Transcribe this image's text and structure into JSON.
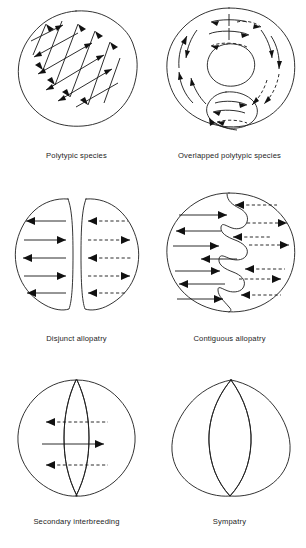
{
  "figure": {
    "background_color": "#ffffff",
    "ink_color": "#1a1a1a",
    "panel_count": 6,
    "columns": 2,
    "rows": 3
  },
  "panels": [
    {
      "id": "polytypic-species",
      "caption": "Polytypic species",
      "row": 1,
      "column": 1,
      "shape": "single irregular wobbly circle",
      "boundary": "none",
      "arrow_style": "solid diagonal crosshatch, bidirectional",
      "arrow_count": 16,
      "description": "One continuous range with gene flow arrows crossing diagonally in both directions throughout"
    },
    {
      "id": "overlapped-polytypic-species",
      "caption": "Overlapped polytypic species",
      "row": 1,
      "column": 2,
      "shape": "large irregular blob enclosing an upper inner blob and a lower smaller blob",
      "boundary": "inner closed outlines",
      "arrow_style": "curved circulating solid and dashed",
      "arrow_count": 18,
      "description": "Ring-shaped outer range circulating around inner enclosed subranges"
    },
    {
      "id": "disjunct-allopatry",
      "caption": "Disjunct allopatry",
      "row": 2,
      "column": 1,
      "shape": "two separated half-circle lobes with a clear gap between them",
      "boundary": "physical gap",
      "arrow_style": "left lobe solid horizontal, right lobe dashed horizontal",
      "arrow_count": 10,
      "description": "Two fully separated ranges; five alternating arrows in each lobe"
    },
    {
      "id": "contiguous-allopatry",
      "caption": "Contiguous allopatry",
      "row": 2,
      "column": 2,
      "shape": "single circle divided by a deeply interlocking zigzag boundary",
      "boundary": "wavy interdigitating line",
      "arrow_style": "left side solid horizontal, right side dashed horizontal",
      "arrow_count": 14,
      "description": "Two abutting ranges meeting along a convoluted contact zone"
    },
    {
      "id": "secondary-interbreeding",
      "caption": "Secondary interbreeding",
      "row": 3,
      "column": 1,
      "shape": "two broad overlapping circles forming a narrow central lens",
      "boundary": "lens-shaped overlap zone",
      "arrow_style": "dashed left, solid right, dashed left",
      "arrow_count": 3,
      "description": "Ranges overlapping in a narrow hybrid zone with gene flow across it"
    },
    {
      "id": "sympatry",
      "caption": "Sympatry",
      "row": 3,
      "column": 2,
      "shape": "two nearly coincident lens outlines meeting at top and bottom points",
      "boundary": "near-complete overlap",
      "arrow_style": "none",
      "arrow_count": 0,
      "description": "Two ranges almost entirely coincident; no gene flow arrows drawn"
    }
  ]
}
